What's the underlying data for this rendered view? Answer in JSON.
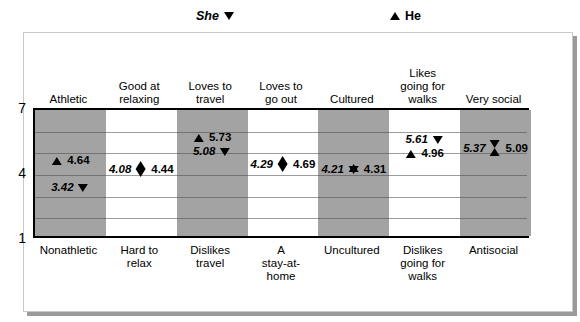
{
  "legend": {
    "she": {
      "label": "She",
      "marker": "triangle-down-icon"
    },
    "he": {
      "label": "He",
      "marker": "triangle-up-icon"
    }
  },
  "chart_data": {
    "type": "scatter",
    "title": "",
    "xlabel": "",
    "ylabel": "",
    "ylim": [
      1,
      7
    ],
    "yticks": [
      1,
      4,
      7
    ],
    "ytick_labels": [
      "1",
      "4",
      "7"
    ],
    "grid": true,
    "legend_position": "top",
    "categories": [
      "Athletic",
      "Good at relaxing",
      "Loves to travel",
      "Loves to go out",
      "Cultured",
      "Likes going for walks",
      "Very social"
    ],
    "categories_bottom": [
      "Nonathletic",
      "Hard to relax",
      "Dislikes travel",
      "A stay-at-home",
      "Uncultured",
      "Dislikes going for walks",
      "Antisocial"
    ],
    "series": [
      {
        "name": "She",
        "marker": "triangle-down-icon",
        "values": [
          3.42,
          4.08,
          5.08,
          4.29,
          4.21,
          5.61,
          5.37
        ]
      },
      {
        "name": "He",
        "marker": "triangle-up-icon",
        "values": [
          4.64,
          4.44,
          5.73,
          4.69,
          4.31,
          4.96,
          5.09
        ]
      }
    ],
    "band_shading": [
      "shaded",
      "plain",
      "shaded",
      "plain",
      "shaded",
      "plain",
      "shaded"
    ],
    "colors": {
      "band_shaded": "#a3a3a3",
      "band_plain": "#ffffff",
      "marker": "#000000",
      "frame": "#000000"
    }
  },
  "top_labels": [
    {
      "line1": "Athletic",
      "line2": ""
    },
    {
      "line1": "Good at",
      "line2": "relaxing"
    },
    {
      "line1": "Loves to",
      "line2": "travel"
    },
    {
      "line1": "Loves to",
      "line2": "go out"
    },
    {
      "line1": "Cultured",
      "line2": ""
    },
    {
      "line1": "Likes",
      "line2": "going for",
      "line3": "walks"
    },
    {
      "line1": "Very social",
      "line2": ""
    }
  ],
  "bottom_labels": [
    {
      "line1": "Nonathletic",
      "line2": "",
      "line3": ""
    },
    {
      "line1": "Hard to",
      "line2": "relax",
      "line3": ""
    },
    {
      "line1": "Dislikes",
      "line2": "travel",
      "line3": ""
    },
    {
      "line1": "A",
      "line2": "stay-at-",
      "line3": "home"
    },
    {
      "line1": "Uncultured",
      "line2": "",
      "line3": ""
    },
    {
      "line1": "Dislikes",
      "line2": "going for",
      "line3": "walks"
    },
    {
      "line1": "Antisocial",
      "line2": "",
      "line3": ""
    }
  ],
  "markers": [
    {
      "col": 0,
      "layout": "separate",
      "she": "3.42",
      "he": "4.64"
    },
    {
      "col": 1,
      "layout": "diamond",
      "she": "4.08",
      "he": "4.44"
    },
    {
      "col": 2,
      "layout": "separate",
      "she": "5.08",
      "he": "5.73"
    },
    {
      "col": 3,
      "layout": "diamond",
      "she": "4.29",
      "he": "4.69"
    },
    {
      "col": 4,
      "layout": "star",
      "she": "4.21",
      "he": "4.31"
    },
    {
      "col": 5,
      "layout": "separate",
      "she": "5.61",
      "he": "4.96"
    },
    {
      "col": 6,
      "layout": "hourglass",
      "she": "5.37",
      "he": "5.09"
    }
  ],
  "y_ticks": [
    "7",
    "4",
    "1"
  ]
}
